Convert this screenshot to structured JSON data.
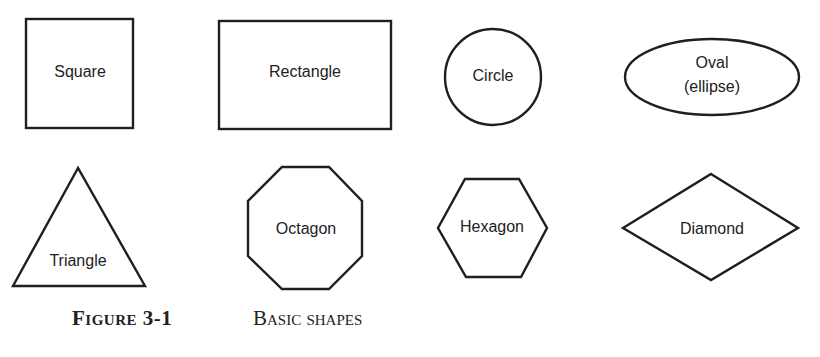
{
  "figure": {
    "number": "Figure 3-1",
    "title": "Basic shapes"
  },
  "shapes": [
    {
      "id": "square",
      "label": "Square"
    },
    {
      "id": "rectangle",
      "label": "Rectangle"
    },
    {
      "id": "circle",
      "label": "Circle"
    },
    {
      "id": "oval",
      "label_line1": "Oval",
      "label_line2": "(ellipse)"
    },
    {
      "id": "triangle",
      "label": "Triangle"
    },
    {
      "id": "octagon",
      "label": "Octagon"
    },
    {
      "id": "hexagon",
      "label": "Hexagon"
    },
    {
      "id": "diamond",
      "label": "Diamond"
    }
  ],
  "colors": {
    "stroke": "#1f1f1f",
    "text": "#222222",
    "background": "#ffffff"
  }
}
